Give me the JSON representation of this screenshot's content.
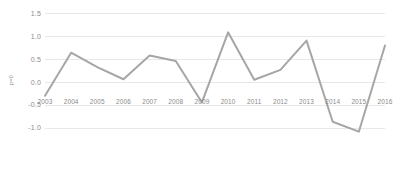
{
  "chart_data": {
    "type": "line",
    "title": "",
    "subtitle": "",
    "xlabel": "",
    "ylabel": "p=0",
    "categories": [
      "2003",
      "2004",
      "2005",
      "2006",
      "2007",
      "2008",
      "2009",
      "2010",
      "2011",
      "2012",
      "2013",
      "2014",
      "2015",
      "2016"
    ],
    "values": [
      0.0,
      0.78,
      0.52,
      0.3,
      0.73,
      0.63,
      -0.12,
      1.15,
      0.29,
      0.47,
      1.0,
      -0.47,
      -0.65,
      0.91
    ],
    "series": [
      {
        "name": "series-1",
        "values": [
          0.0,
          0.78,
          0.52,
          0.3,
          0.73,
          0.63,
          -0.12,
          1.15,
          0.29,
          0.47,
          1.0,
          -0.47,
          -0.65,
          0.91
        ],
        "color": "#a6a6a6"
      }
    ],
    "ylim": [
      -1.0,
      1.5
    ],
    "yticks": [
      1.5,
      1.0,
      0.5,
      0.0,
      -0.5,
      -1.0
    ],
    "ytick_labels": [
      "1.5",
      "1.0",
      "0.5",
      "0.0",
      "-0.5",
      "-1.0"
    ],
    "grid": true,
    "grid_color": "#e8e8e8",
    "legend": false,
    "legend_position": "none",
    "background": "#ffffff",
    "axis_text_color": "#8c8c8c",
    "line_color": "#a6a6a6",
    "line_width": 2
  }
}
